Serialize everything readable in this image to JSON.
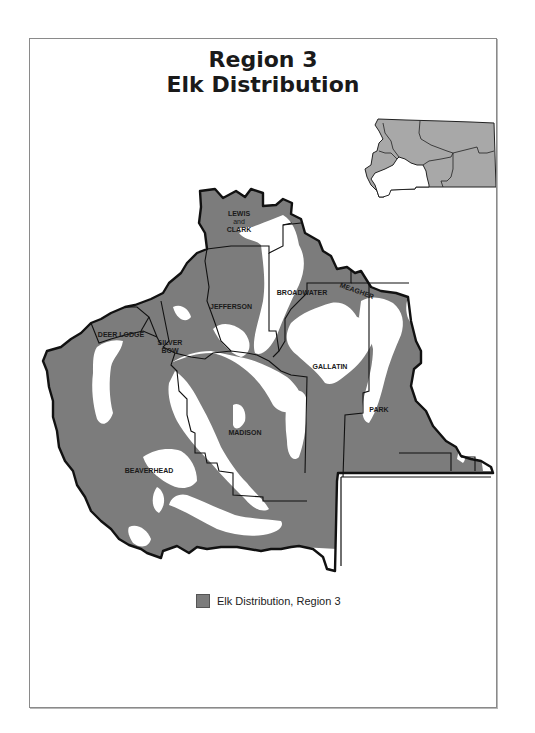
{
  "title": {
    "line1": "Region 3",
    "line2": "Elk Distribution"
  },
  "colors": {
    "elk_distribution": "#7c7c7c",
    "non_distribution": "#ffffff",
    "inset_state_fill": "#a8a8a8",
    "inset_region_fill": "#ffffff",
    "boundary": "#111111"
  },
  "counties": [
    {
      "id": "lewis-and-clark",
      "label_lines": [
        "LEWIS",
        "and",
        "CLARK"
      ]
    },
    {
      "id": "broadwater",
      "label_lines": [
        "BROADWATER"
      ]
    },
    {
      "id": "meagher",
      "label_lines": [
        "MEAGHER"
      ]
    },
    {
      "id": "jefferson",
      "label_lines": [
        "JEFFERSON"
      ]
    },
    {
      "id": "deer-lodge",
      "label_lines": [
        "DEER LODGE"
      ]
    },
    {
      "id": "silver-bow",
      "label_lines": [
        "SILVER",
        "BOW"
      ]
    },
    {
      "id": "gallatin",
      "label_lines": [
        "GALLATIN"
      ]
    },
    {
      "id": "madison",
      "label_lines": [
        "MADISON"
      ]
    },
    {
      "id": "park",
      "label_lines": [
        "PARK"
      ]
    },
    {
      "id": "beaverhead",
      "label_lines": [
        "BEAVERHEAD"
      ]
    }
  ],
  "inset": {
    "description": "Montana state outline with Region 3 highlighted"
  },
  "legend": {
    "items": [
      {
        "label": "Elk Distribution, Region 3",
        "color": "#7c7c7c"
      }
    ]
  }
}
